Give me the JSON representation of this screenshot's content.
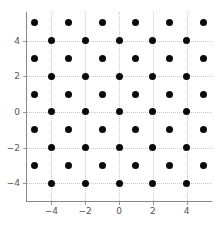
{
  "chart_data": {
    "type": "scatter",
    "title": "",
    "xlabel": "",
    "ylabel": "",
    "xlim": [
      -5.5,
      5.5
    ],
    "ylim": [
      -5.0,
      5.6
    ],
    "grid": true,
    "legend": null,
    "marker": {
      "shape": "circle",
      "color": "#0a0a0a",
      "size_px": 7
    },
    "xticks": [
      -4,
      -2,
      0,
      2,
      4
    ],
    "yticks": [
      -4,
      -2,
      0,
      2,
      4
    ],
    "xtick_labels": [
      "−4",
      "−2",
      "0",
      "2",
      "4"
    ],
    "ytick_labels": [
      "4",
      "2",
      "0",
      "−2",
      "−4"
    ],
    "gridlines_x": [
      -4,
      -2,
      0,
      2,
      4
    ],
    "gridlines_y": [
      -4,
      -2,
      0,
      2,
      4
    ],
    "points": [
      {
        "x": -5,
        "y": 5
      },
      {
        "x": -3,
        "y": 5
      },
      {
        "x": -1,
        "y": 5
      },
      {
        "x": 1,
        "y": 5
      },
      {
        "x": 3,
        "y": 5
      },
      {
        "x": 5,
        "y": 5
      },
      {
        "x": -4,
        "y": 4
      },
      {
        "x": -2,
        "y": 4
      },
      {
        "x": 0,
        "y": 4
      },
      {
        "x": 2,
        "y": 4
      },
      {
        "x": 4,
        "y": 4
      },
      {
        "x": -5,
        "y": 3
      },
      {
        "x": -3,
        "y": 3
      },
      {
        "x": -1,
        "y": 3
      },
      {
        "x": 1,
        "y": 3
      },
      {
        "x": 3,
        "y": 3
      },
      {
        "x": 5,
        "y": 3
      },
      {
        "x": -4,
        "y": 2
      },
      {
        "x": -2,
        "y": 2
      },
      {
        "x": 0,
        "y": 2
      },
      {
        "x": 2,
        "y": 2
      },
      {
        "x": 4,
        "y": 2
      },
      {
        "x": -5,
        "y": 1
      },
      {
        "x": -3,
        "y": 1
      },
      {
        "x": -1,
        "y": 1
      },
      {
        "x": 1,
        "y": 1
      },
      {
        "x": 3,
        "y": 1
      },
      {
        "x": 5,
        "y": 1
      },
      {
        "x": -4,
        "y": 0
      },
      {
        "x": -2,
        "y": 0
      },
      {
        "x": 0,
        "y": 0
      },
      {
        "x": 2,
        "y": 0
      },
      {
        "x": 4,
        "y": 0
      },
      {
        "x": -5,
        "y": -1
      },
      {
        "x": -3,
        "y": -1
      },
      {
        "x": -1,
        "y": -1
      },
      {
        "x": 1,
        "y": -1
      },
      {
        "x": 3,
        "y": -1
      },
      {
        "x": 5,
        "y": -1
      },
      {
        "x": -4,
        "y": -2
      },
      {
        "x": -2,
        "y": -2
      },
      {
        "x": 0,
        "y": -2
      },
      {
        "x": 2,
        "y": -2
      },
      {
        "x": 4,
        "y": -2
      },
      {
        "x": -5,
        "y": -3
      },
      {
        "x": -3,
        "y": -3
      },
      {
        "x": -1,
        "y": -3
      },
      {
        "x": 1,
        "y": -3
      },
      {
        "x": 3,
        "y": -3
      },
      {
        "x": 5,
        "y": -3
      },
      {
        "x": -4,
        "y": -4
      },
      {
        "x": -2,
        "y": -4
      },
      {
        "x": 0,
        "y": -4
      },
      {
        "x": 2,
        "y": -4
      },
      {
        "x": 4,
        "y": -4
      }
    ]
  },
  "colors": {
    "marker": "#0a0a0a",
    "grid": "#c9c9c9",
    "spine": "#888888",
    "tick_label": "#555555",
    "background": "#ffffff"
  }
}
